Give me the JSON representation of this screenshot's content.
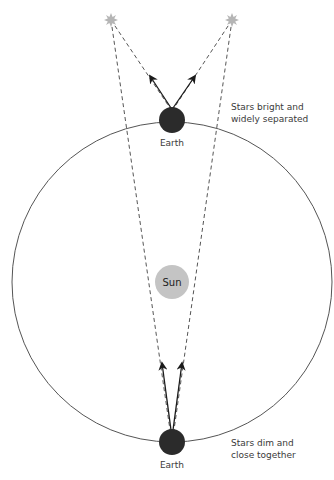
{
  "diagram": {
    "type": "astronomy-parallax-brightness",
    "labels": {
      "sun": "Sun",
      "earth_top": "Earth",
      "earth_bottom": "Earth",
      "note_top_line1": "Stars bright and",
      "note_top_line2": "widely separated",
      "note_bottom_line1": "Stars dim and",
      "note_bottom_line2": "close together"
    },
    "colors": {
      "orbit": "#555555",
      "earth": "#2b2b2b",
      "sun": "#c4c4c4",
      "star": "#b5b5b5",
      "dashed": "#555555",
      "arrow": "#1a1a1a",
      "text": "#3a3a3a"
    },
    "elements": {
      "orbit": {
        "cx": 172,
        "cy": 282,
        "r": 160
      },
      "sun": {
        "cx": 172,
        "cy": 282,
        "r": 17
      },
      "earth_top": {
        "cx": 172,
        "cy": 120,
        "r": 13
      },
      "earth_bottom": {
        "cx": 172,
        "cy": 442,
        "r": 13
      },
      "star_left": {
        "cx": 111,
        "cy": 20
      },
      "star_right": {
        "cx": 232,
        "cy": 20
      }
    }
  }
}
